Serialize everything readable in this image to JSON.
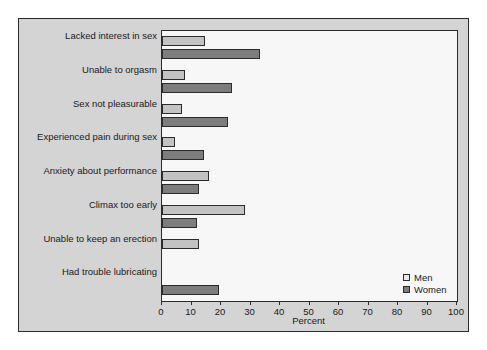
{
  "chart_data": {
    "type": "bar",
    "orientation": "horizontal",
    "title": "",
    "xlabel": "Percent",
    "ylabel": "",
    "xlim": [
      0,
      100
    ],
    "xticks": [
      0,
      10,
      20,
      30,
      40,
      50,
      60,
      70,
      80,
      90,
      100
    ],
    "grid": false,
    "legend_position": "bottom-right",
    "categories": [
      "Lacked interest in sex",
      "Unable to orgasm",
      "Sex not pleasurable",
      "Experienced pain during sex",
      "Anxiety about performance",
      "Climax too early",
      "Unable to keep an erection",
      "Had trouble lubricating"
    ],
    "series": [
      {
        "name": "Men",
        "color": "#c3c3c3",
        "values": [
          14.6,
          7.8,
          6.8,
          4.4,
          15.9,
          28.1,
          12.5,
          null
        ]
      },
      {
        "name": "Women",
        "color": "#7d7d7d",
        "values": [
          33.2,
          23.7,
          22.4,
          14.2,
          12.5,
          12.0,
          null,
          19.3
        ]
      }
    ]
  },
  "legend": {
    "entries": [
      {
        "label": "Men",
        "swatch": "men"
      },
      {
        "label": "Women",
        "swatch": "women"
      }
    ]
  },
  "colors": {
    "figure_background": "#d4d4d4",
    "plot_background": "#f7f7f7",
    "axis": "#2b2b2b",
    "men_bar": "#c3c3c3",
    "women_bar": "#7d7d7d"
  }
}
